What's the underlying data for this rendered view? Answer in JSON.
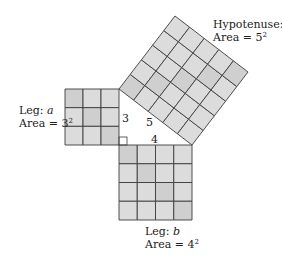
{
  "diagram": {
    "colors": {
      "fill": "#dcdcdc",
      "fill_dark": "#cfcfcf",
      "line": "#3c3c3c",
      "background": "#ffffff"
    },
    "triangle": {
      "vertices": {
        "A": [
          119,
          89
        ],
        "C": [
          119,
          145
        ],
        "B": [
          192,
          145
        ]
      },
      "side_labels": {
        "a": "3",
        "b": "4",
        "c": "5"
      },
      "right_angle_marker": true
    },
    "squares": [
      {
        "id": "leg-a",
        "n": 3,
        "corners": [
          [
            65,
            89
          ],
          [
            119,
            89
          ],
          [
            119,
            145
          ],
          [
            65,
            145
          ]
        ]
      },
      {
        "id": "leg-b",
        "n": 4,
        "corners": [
          [
            119,
            145
          ],
          [
            192,
            145
          ],
          [
            192,
            220
          ],
          [
            119,
            220
          ]
        ]
      },
      {
        "id": "hypotenuse-c",
        "n": 5,
        "corners": [
          [
            119,
            89
          ],
          [
            192,
            145
          ],
          [
            248,
            72
          ],
          [
            175,
            16
          ]
        ]
      }
    ],
    "labels": {
      "hyp": {
        "name_prefix": "Hypotenuse: ",
        "var": "c",
        "area_prefix": "Area = ",
        "base": "5",
        "exp": "2"
      },
      "leg_a": {
        "name_prefix": "Leg: ",
        "var": "a",
        "area_prefix": "Area = ",
        "base": "3",
        "exp": "2"
      },
      "leg_b": {
        "name_prefix": "Leg: ",
        "var": "b",
        "area_prefix": "Area = ",
        "base": "4",
        "exp": "2"
      }
    }
  }
}
